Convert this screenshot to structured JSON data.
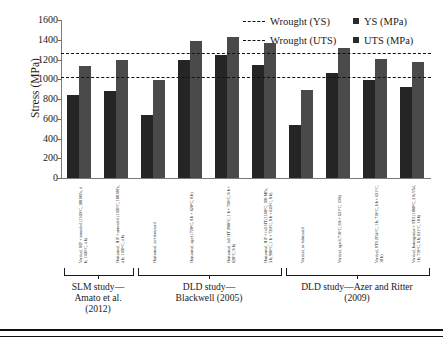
{
  "chart_data": {
    "type": "bar",
    "title": "",
    "xlabel": "",
    "ylabel": "Stress (MPa)",
    "ylim": [
      0,
      1600
    ],
    "ytick_step": 200,
    "yticks": [
      1600,
      1400,
      1200,
      1000,
      800,
      600,
      400,
      200,
      0
    ],
    "grid": false,
    "legend_position": "top-right",
    "categories": [
      "Vertical, HIP + annealed (1160°C, 100 MPa, 4 h; 1160°C, 4 h)",
      "Horizontal, HIP + annealed (1160°C, 100 MPa, 4 h; 1160°C, 4 h)",
      "Horizontal, as-fabricated",
      "Horizontal, aged (720°C, 8 h + 620°C, 8 h)",
      "Horizontal, full HT (980°C, 1 h + 720°C, 8 h + 620°C, 8 h)",
      "Horizontal, HIP + full HT (1160°C, 100 MPa, 3 h; 980°C, 1 h + 720°C, 8 h + 620°C, 8 h)",
      "Vertical, as-fabricated",
      "Vertical, aged (718°C, 6 h + 621°C, 10 h)",
      "Vertical, STA (954°C, 1 h; 718°C, 6 h + 621°C, 10 h)",
      "Vertical, homogenize + STA (1080°C, 2 h; 954, 1 h; 718°C, 6 h; 621°C, 10 h)"
    ],
    "series": [
      {
        "name": "YS (MPa)",
        "color": "#252525",
        "values": [
          840,
          880,
          640,
          1195,
          1250,
          1145,
          535,
          1060,
          990,
          925
        ]
      },
      {
        "name": "UTS (MPa)",
        "color": "#4a4a4a",
        "values": [
          1130,
          1195,
          995,
          1385,
          1425,
          1370,
          890,
          1315,
          1205,
          1175
        ]
      }
    ],
    "reference_lines": [
      {
        "label": "Wrought (YS)",
        "value": 1020,
        "style": "dashed",
        "color": "#111111"
      },
      {
        "label": "Wrought (UTS)",
        "value": 1270,
        "style": "dashed",
        "color": "#111111"
      }
    ],
    "groups": [
      {
        "label": "SLM study—\nAmato et al.\n(2012)",
        "from": 0,
        "to": 1
      },
      {
        "label": "DLD study—\nBlackwell (2005)",
        "from": 2,
        "to": 5
      },
      {
        "label": "DLD study—Azer and Ritter\n(2009)",
        "from": 6,
        "to": 9
      }
    ]
  },
  "legend": {
    "entries": [
      {
        "label": "Wrought (YS)",
        "marker": "dashed-line"
      },
      {
        "label": "Wrought (UTS)",
        "marker": "dashed-line"
      },
      {
        "label": "YS (MPa)",
        "marker": "filled-square"
      },
      {
        "label": "UTS (MPa)",
        "marker": "filled-square"
      }
    ]
  }
}
